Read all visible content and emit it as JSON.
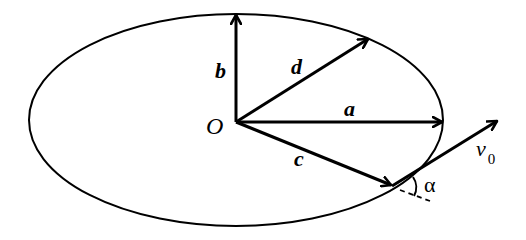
{
  "diagram": {
    "ellipse": {
      "cx": 236,
      "cy": 120,
      "rx": 207,
      "ry": 106
    },
    "origin": {
      "label": "O",
      "x": 236,
      "y": 122
    },
    "vectors": [
      {
        "name": "a",
        "label": "a",
        "from": [
          236,
          122
        ],
        "to": [
          443,
          122
        ]
      },
      {
        "name": "b",
        "label": "b",
        "from": [
          236,
          122
        ],
        "to": [
          236,
          14
        ]
      },
      {
        "name": "c",
        "label": "c",
        "from": [
          236,
          122
        ],
        "to": [
          392,
          186
        ]
      },
      {
        "name": "d",
        "label": "d",
        "from": [
          236,
          122
        ],
        "to": [
          368,
          38
        ]
      },
      {
        "name": "v0",
        "label": "v",
        "subscript": "0",
        "from": [
          392,
          186
        ],
        "to": [
          498,
          120
        ]
      }
    ],
    "angle": {
      "label": "α"
    }
  }
}
